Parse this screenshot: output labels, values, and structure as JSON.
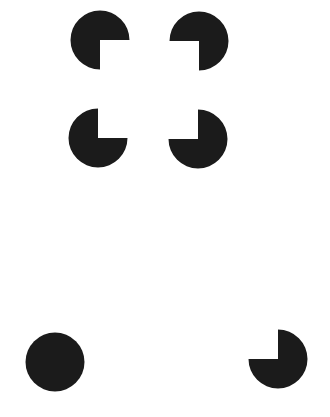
{
  "figure": {
    "background_color": "#ffffff",
    "shape_color": "#1b1b1b",
    "width": 330,
    "height": 417
  },
  "shapes": [
    {
      "name": "pacman-top-left",
      "type": "pacman",
      "cx": 100,
      "cy": 40,
      "r": 29.5,
      "missing_quadrant": "bottom-right"
    },
    {
      "name": "pacman-top-right",
      "type": "pacman",
      "cx": 199,
      "cy": 41,
      "r": 29.5,
      "missing_quadrant": "bottom-left"
    },
    {
      "name": "pacman-bottom-left",
      "type": "pacman",
      "cx": 98,
      "cy": 138,
      "r": 29.5,
      "missing_quadrant": "top-right"
    },
    {
      "name": "pacman-bottom-right",
      "type": "pacman",
      "cx": 198,
      "cy": 139,
      "r": 29.5,
      "missing_quadrant": "top-left"
    },
    {
      "name": "full-disc",
      "type": "circle",
      "cx": 55,
      "cy": 362,
      "r": 29.5
    },
    {
      "name": "pacman-lone",
      "type": "pacman",
      "cx": 278,
      "cy": 359,
      "r": 29.5,
      "missing_quadrant": "top-left"
    }
  ]
}
